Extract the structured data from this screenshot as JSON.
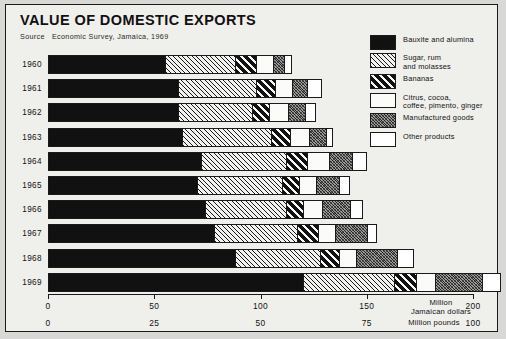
{
  "title": "VALUE OF DOMESTIC EXPORTS",
  "source": {
    "label": "Source",
    "text": "Economic Survey, Jamaica, 1969"
  },
  "legend": [
    {
      "key": "bauxite",
      "pattern": "p-bauxite",
      "lines": [
        "Bauxite and alumina"
      ]
    },
    {
      "key": "sugar",
      "pattern": "p-sugar",
      "lines": [
        "Sugar, rum",
        "and molasses"
      ]
    },
    {
      "key": "bananas",
      "pattern": "p-bananas",
      "lines": [
        "Bananas"
      ]
    },
    {
      "key": "citrus",
      "pattern": "p-citrus",
      "lines": [
        "Citrus, cocoa,",
        "coffee, pimento, ginger"
      ]
    },
    {
      "key": "manuf",
      "pattern": "p-manuf",
      "lines": [
        "Manufactured goods"
      ]
    },
    {
      "key": "other",
      "pattern": "p-other",
      "lines": [
        "Other products"
      ]
    }
  ],
  "axis": {
    "primary": {
      "unit_lines": [
        "Million",
        "Jamaican dollars"
      ],
      "ticks": [
        "0",
        "50",
        "100",
        "150",
        "200"
      ],
      "values": [
        0,
        50,
        100,
        150,
        200
      ],
      "max": 200
    },
    "secondary": {
      "unit_lines": [
        "Million pounds"
      ],
      "ticks": [
        "0",
        "25",
        "50",
        "75",
        "100"
      ],
      "values": [
        0,
        25,
        50,
        75,
        100
      ],
      "max": 100
    }
  },
  "chart_data": {
    "type": "bar",
    "orientation": "horizontal",
    "stacked": true,
    "title": "VALUE OF DOMESTIC EXPORTS",
    "xlabel": "Million Jamaican dollars",
    "ylabel": "",
    "xlim": [
      0,
      200
    ],
    "grid": false,
    "legend_position": "right",
    "categories": [
      "1960",
      "1961",
      "1962",
      "1963",
      "1964",
      "1965",
      "1966",
      "1967",
      "1968",
      "1969"
    ],
    "series": [
      {
        "name": "Bauxite and alumina",
        "values": [
          55,
          61,
          61,
          63,
          72,
          70,
          74,
          78,
          88,
          120
        ]
      },
      {
        "name": "Sugar, rum and molasses",
        "values": [
          33,
          37,
          35,
          42,
          40,
          40,
          38,
          39,
          40,
          43
        ]
      },
      {
        "name": "Bananas",
        "values": [
          10,
          9,
          8,
          9,
          10,
          8,
          8,
          10,
          9,
          10
        ]
      },
      {
        "name": "Citrus, cocoa, coffee, pimento, ginger",
        "values": [
          8,
          8,
          9,
          9,
          10,
          8,
          9,
          8,
          8,
          9
        ]
      },
      {
        "name": "Manufactured goods",
        "values": [
          5,
          7,
          8,
          8,
          11,
          11,
          13,
          15,
          19,
          22
        ]
      },
      {
        "name": "Other products",
        "values": [
          4,
          7,
          5,
          3,
          7,
          5,
          6,
          5,
          8,
          9
        ]
      }
    ],
    "totals": [
      115,
      129,
      126,
      134,
      150,
      142,
      148,
      155,
      172,
      213
    ]
  }
}
